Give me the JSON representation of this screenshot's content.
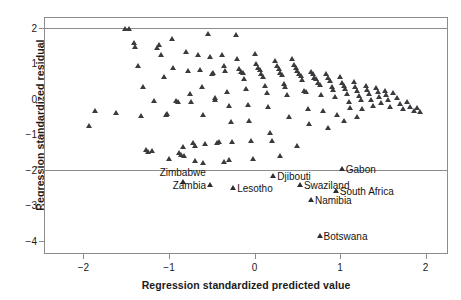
{
  "chart_data": {
    "type": "scatter",
    "title": "",
    "xlabel": "Regression standardized predicted value",
    "ylabel": "Regression standardized residual",
    "xlim": [
      -2.45,
      2.25
    ],
    "ylim": [
      -4.35,
      2.28
    ],
    "xticks": [
      -2,
      -1,
      0,
      1,
      2
    ],
    "xticklabels": [
      "−2",
      "−1",
      "0",
      "1",
      "2"
    ],
    "yticks": [
      2,
      1,
      0,
      -1,
      -2,
      -3,
      -4
    ],
    "yticklabels": [
      "2",
      "1",
      "0",
      "−1",
      "−2",
      "−3",
      "−4"
    ],
    "grid": false,
    "reference_lines": [
      2,
      -2
    ],
    "marker": "triangle-up",
    "marker_color": "#3a3a3f",
    "points": [
      [
        -1.52,
        1.98
      ],
      [
        -1.86,
        -0.33
      ],
      [
        -1.93,
        -0.77
      ],
      [
        -1.62,
        -0.4
      ],
      [
        -1.47,
        1.98
      ],
      [
        -1.4,
        1.46
      ],
      [
        -1.41,
        1.58
      ],
      [
        -1.36,
        0.93
      ],
      [
        -1.33,
        -0.49
      ],
      [
        -1.3,
        0.32
      ],
      [
        -1.27,
        -1.43
      ],
      [
        -1.24,
        -1.5
      ],
      [
        -1.2,
        -1.47
      ],
      [
        -1.18,
        -0.07
      ],
      [
        -1.14,
        1.43
      ],
      [
        -1.12,
        1.52
      ],
      [
        -1.09,
        1.25
      ],
      [
        -1.06,
        0.62
      ],
      [
        -1.04,
        -0.45
      ],
      [
        -1.02,
        -0.43
      ],
      [
        -1.0,
        -1.7
      ],
      [
        -0.97,
        1.7
      ],
      [
        -0.95,
        0.86
      ],
      [
        -0.92,
        -0.05
      ],
      [
        -0.9,
        -0.09
      ],
      [
        -0.88,
        -1.52
      ],
      [
        -0.86,
        -1.58
      ],
      [
        -0.84,
        -1.35
      ],
      [
        -0.82,
        -1.62
      ],
      [
        -0.8,
        1.33
      ],
      [
        -0.78,
        0.79
      ],
      [
        -0.76,
        0.14
      ],
      [
        -0.74,
        -0.1
      ],
      [
        -0.72,
        -1.26
      ],
      [
        -0.7,
        -1.33
      ],
      [
        -0.66,
        1.24
      ],
      [
        -0.64,
        0.82
      ],
      [
        -0.62,
        0.33
      ],
      [
        -0.6,
        -0.46
      ],
      [
        -0.58,
        -1.28
      ],
      [
        -0.55,
        1.83
      ],
      [
        -0.52,
        1.18
      ],
      [
        -0.5,
        0.7
      ],
      [
        -0.48,
        0.73
      ],
      [
        -0.46,
        -0.03
      ],
      [
        -0.44,
        -1.26
      ],
      [
        -0.42,
        -1.23
      ],
      [
        -0.38,
        1.24
      ],
      [
        -0.36,
        0.93
      ],
      [
        -0.34,
        0.78
      ],
      [
        -0.32,
        0.2
      ],
      [
        -0.3,
        -0.19
      ],
      [
        -0.28,
        -0.66
      ],
      [
        -0.26,
        -1.22
      ],
      [
        -0.22,
        1.8
      ],
      [
        -0.2,
        1.12
      ],
      [
        -0.18,
        0.84
      ],
      [
        -0.16,
        0.76
      ],
      [
        -0.14,
        0.72
      ],
      [
        -0.12,
        0.55
      ],
      [
        -0.1,
        0.27
      ],
      [
        -0.08,
        -0.17
      ],
      [
        -0.06,
        -0.62
      ],
      [
        -0.04,
        -1.2
      ],
      [
        0.0,
        1.26
      ],
      [
        0.02,
        0.97
      ],
      [
        0.04,
        0.88
      ],
      [
        0.06,
        0.8
      ],
      [
        0.08,
        0.69
      ],
      [
        0.1,
        0.61
      ],
      [
        0.12,
        0.36
      ],
      [
        0.14,
        0.17
      ],
      [
        0.16,
        -0.22
      ],
      [
        0.18,
        -0.96
      ],
      [
        0.2,
        -1.18
      ],
      [
        0.24,
        1.06
      ],
      [
        0.26,
        0.92
      ],
      [
        0.28,
        0.83
      ],
      [
        0.3,
        0.74
      ],
      [
        0.32,
        0.66
      ],
      [
        0.34,
        0.43
      ],
      [
        0.36,
        0.32
      ],
      [
        0.38,
        0.1
      ],
      [
        0.4,
        -0.5
      ],
      [
        0.44,
        1.12
      ],
      [
        0.46,
        0.95
      ],
      [
        0.48,
        0.87
      ],
      [
        0.5,
        0.79
      ],
      [
        0.52,
        0.71
      ],
      [
        0.54,
        0.63
      ],
      [
        0.56,
        0.52
      ],
      [
        0.58,
        0.22
      ],
      [
        0.6,
        0.18
      ],
      [
        0.62,
        -0.28
      ],
      [
        0.66,
        0.76
      ],
      [
        0.68,
        0.69
      ],
      [
        0.7,
        0.6
      ],
      [
        0.72,
        0.56
      ],
      [
        0.74,
        0.45
      ],
      [
        0.76,
        0.39
      ],
      [
        0.78,
        0.12
      ],
      [
        0.8,
        -0.35
      ],
      [
        0.84,
        0.7
      ],
      [
        0.86,
        0.58
      ],
      [
        0.88,
        0.5
      ],
      [
        0.9,
        0.34
      ],
      [
        0.92,
        0.26
      ],
      [
        0.94,
        0.05
      ],
      [
        0.96,
        -0.46
      ],
      [
        1.0,
        0.62
      ],
      [
        1.02,
        0.44
      ],
      [
        1.04,
        0.36
      ],
      [
        1.06,
        0.28
      ],
      [
        1.08,
        0.13
      ],
      [
        1.1,
        -0.08
      ],
      [
        1.12,
        -0.26
      ],
      [
        1.16,
        0.48
      ],
      [
        1.18,
        0.33
      ],
      [
        1.2,
        0.22
      ],
      [
        1.22,
        0.08
      ],
      [
        1.24,
        -0.04
      ],
      [
        1.26,
        -0.3
      ],
      [
        1.3,
        0.37
      ],
      [
        1.32,
        0.24
      ],
      [
        1.34,
        0.14
      ],
      [
        1.36,
        -0.02
      ],
      [
        1.38,
        -0.2
      ],
      [
        1.42,
        0.3
      ],
      [
        1.44,
        0.18
      ],
      [
        1.46,
        0.06
      ],
      [
        1.48,
        -0.12
      ],
      [
        1.52,
        0.22
      ],
      [
        1.54,
        0.1
      ],
      [
        1.56,
        -0.04
      ],
      [
        1.58,
        -0.24
      ],
      [
        1.62,
        0.15
      ],
      [
        1.66,
        0.02
      ],
      [
        1.7,
        -0.16
      ],
      [
        1.74,
        -0.3
      ],
      [
        1.78,
        -0.08
      ],
      [
        1.82,
        -0.22
      ],
      [
        1.86,
        -0.34
      ],
      [
        1.9,
        -0.26
      ],
      [
        1.94,
        -0.38
      ],
      [
        -0.46,
        0.02
      ],
      [
        0.64,
        -0.72
      ],
      [
        0.5,
        -1.34
      ],
      [
        0.3,
        -1.62
      ],
      [
        -0.02,
        -1.7
      ],
      [
        -0.7,
        -1.75
      ],
      [
        -0.6,
        -1.8
      ],
      [
        -0.36,
        -1.78
      ],
      [
        -0.3,
        -1.72
      ],
      [
        0.86,
        -0.82
      ],
      [
        1.04,
        -0.64
      ],
      [
        1.2,
        -0.52
      ]
    ],
    "outliers": [
      {
        "label": "Zimbabwe",
        "x": -0.84,
        "y": -2.35,
        "label_side": "above"
      },
      {
        "label": "Zambia",
        "x": -0.52,
        "y": -2.42,
        "label_side": "left"
      },
      {
        "label": "Lesotho",
        "x": -0.25,
        "y": -2.52,
        "label_side": "right"
      },
      {
        "label": "Djibouti",
        "x": 0.22,
        "y": -2.18,
        "label_side": "right"
      },
      {
        "label": "Swaziland",
        "x": 0.53,
        "y": -2.42,
        "label_side": "right"
      },
      {
        "label": "Gabon",
        "x": 1.02,
        "y": -1.99,
        "label_side": "right"
      },
      {
        "label": "South Africa",
        "x": 0.95,
        "y": -2.6,
        "label_side": "right"
      },
      {
        "label": "Namibia",
        "x": 0.66,
        "y": -2.86,
        "label_side": "right"
      },
      {
        "label": "Botswana",
        "x": 0.76,
        "y": -3.88,
        "label_side": "right"
      }
    ]
  }
}
